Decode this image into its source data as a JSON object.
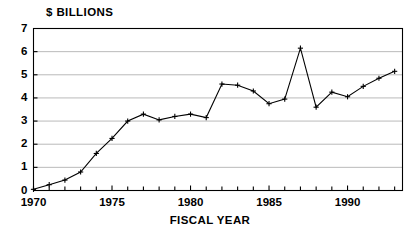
{
  "chart_data": {
    "type": "line",
    "title": "",
    "ylabel": "$ BILLIONS",
    "xlabel": "FISCAL YEAR",
    "xlim": [
      1970,
      1993.5
    ],
    "ylim": [
      0,
      7
    ],
    "grid": true,
    "legend": null,
    "marker": "plus",
    "line_color": "#000000",
    "x": [
      1970,
      1971,
      1972,
      1973,
      1974,
      1975,
      1976,
      1977,
      1978,
      1979,
      1980,
      1981,
      1982,
      1983,
      1984,
      1985,
      1986,
      1987,
      1988,
      1989,
      1990,
      1991,
      1992,
      1993
    ],
    "values": [
      0.05,
      0.25,
      0.45,
      0.8,
      1.6,
      2.25,
      3.0,
      3.3,
      3.05,
      3.2,
      3.3,
      3.15,
      4.6,
      4.55,
      4.3,
      3.75,
      3.95,
      6.15,
      3.6,
      4.25,
      4.05,
      4.5,
      4.85,
      5.15
    ],
    "ytick_labels": [
      "7",
      "6",
      "5",
      "4",
      "3",
      "2",
      "1",
      "0"
    ],
    "ytick_values": [
      7,
      6,
      5,
      4,
      3,
      2,
      1,
      0
    ],
    "xtick_labels": [
      "1970",
      "1975",
      "1980",
      "1985",
      "1990"
    ],
    "xtick_values": [
      1970,
      1975,
      1980,
      1985,
      1990
    ],
    "xtick_minor_values": [
      1971,
      1972,
      1973,
      1974,
      1976,
      1977,
      1978,
      1979,
      1981,
      1982,
      1983,
      1984,
      1986,
      1987,
      1988,
      1989,
      1991,
      1992,
      1993
    ]
  },
  "axes": {
    "ylabel": "$ BILLIONS",
    "xlabel": "FISCAL YEAR"
  }
}
